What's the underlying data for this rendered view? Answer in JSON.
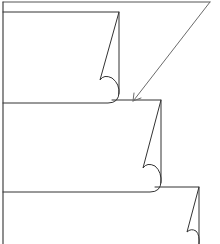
{
  "diagram": {
    "colors": {
      "background": "#ffffff",
      "sheet_stroke": "#333333",
      "arrow_stroke": "#6b6b6b",
      "frame_stroke": "#555555"
    },
    "frame": {
      "top_y": 2,
      "left_x": 3,
      "right_x": 210
    },
    "sheets": [
      {
        "id": "sheet-1",
        "left": 3,
        "top": 12,
        "right": 119,
        "bottom": 103,
        "curl_tip": [
          100,
          80
        ]
      },
      {
        "id": "sheet-2",
        "left": 3,
        "top": 100,
        "right": 161,
        "bottom": 192,
        "curl_tip": [
          143,
          168
        ]
      },
      {
        "id": "sheet-3",
        "left": 3,
        "top": 187,
        "right": 199,
        "bottom": 260,
        "curl_tip": [
          187,
          232
        ]
      }
    ],
    "arrow": {
      "from": [
        210,
        2
      ],
      "to": [
        133,
        101
      ],
      "icon": "arrow-down-left-icon"
    }
  }
}
